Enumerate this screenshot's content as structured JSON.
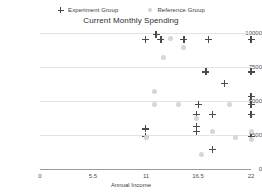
{
  "chart_data": {
    "type": "scatter",
    "title": "Current Monthly Spending",
    "xlabel": "Annual Income",
    "ylabel": "Monthly Spending",
    "xlim": [
      0,
      22
    ],
    "ylim": [
      0,
      10500
    ],
    "grid": true,
    "legend_position": "top-center",
    "xticks": [
      "0",
      "5.5",
      "11",
      "16.5",
      "22"
    ],
    "xtick_values": [
      0,
      5.5,
      11,
      16.5,
      22
    ],
    "yticks": [
      "0",
      "2500",
      "5000",
      "7500",
      "10000"
    ],
    "ytick_values": [
      0,
      2500,
      5000,
      7500,
      10000
    ],
    "colors": {
      "experiment": "#4b4b4b",
      "reference": "#d6d6d6",
      "grid": "#e3e3e3",
      "axis": "#9a9a9a",
      "text": "#3d3d3d"
    },
    "series": [
      {
        "name": "Experiment Group",
        "marker": "plus",
        "color": "#4b4b4b",
        "points": [
          [
            11.0,
            10000
          ],
          [
            12.6,
            10000
          ],
          [
            15.0,
            10000
          ],
          [
            17.6,
            10000
          ],
          [
            22.0,
            10000
          ],
          [
            12.1,
            10400
          ],
          [
            17.3,
            7500
          ],
          [
            22.0,
            7500
          ],
          [
            19.2,
            6600
          ],
          [
            22.0,
            5600
          ],
          [
            16.5,
            5000
          ],
          [
            22.0,
            5000
          ],
          [
            16.3,
            4200
          ],
          [
            18.0,
            4200
          ],
          [
            22.0,
            4200
          ],
          [
            11.0,
            3100
          ],
          [
            16.3,
            3300
          ],
          [
            16.3,
            2900
          ],
          [
            11.0,
            2500
          ],
          [
            22.0,
            2500
          ],
          [
            18.0,
            1500
          ]
        ]
      },
      {
        "name": "Reference Group",
        "marker": "circle",
        "color": "#d6d6d6",
        "points": [
          [
            13.6,
            10100
          ],
          [
            12.9,
            8600
          ],
          [
            15.0,
            9400
          ],
          [
            11.9,
            6000
          ],
          [
            11.9,
            5000
          ],
          [
            14.4,
            5000
          ],
          [
            19.8,
            5000
          ],
          [
            16.3,
            3900
          ],
          [
            18.0,
            2900
          ],
          [
            22.0,
            2900
          ],
          [
            11.1,
            2400
          ],
          [
            20.4,
            2400
          ],
          [
            22.0,
            2300
          ],
          [
            16.8,
            1100
          ]
        ]
      }
    ]
  },
  "legend": {
    "items": [
      {
        "label": "Experiment Group",
        "marker": "plus"
      },
      {
        "label": "Reference Group",
        "marker": "dot"
      }
    ]
  }
}
